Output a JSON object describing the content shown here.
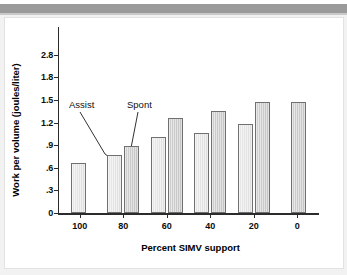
{
  "page": {
    "background_color": "#f2f2f2",
    "header_band_color": "#9a9a9a",
    "card_background": "#ffffff"
  },
  "chart_data": {
    "type": "bar",
    "title": "",
    "xlabel": "Percent SIMV support",
    "ylabel": "Work per volume (joules/liter)",
    "categories": [
      "100",
      "80",
      "60",
      "40",
      "20",
      "0"
    ],
    "series": [
      {
        "name": "Assist",
        "color": "#e4e4e4",
        "values": [
          0.66,
          0.77,
          1.01,
          1.06,
          1.18,
          null
        ]
      },
      {
        "name": "Spont",
        "color": "#cfcfcf",
        "values": [
          null,
          0.89,
          1.26,
          1.35,
          1.47,
          1.47
        ]
      }
    ],
    "ytick_labels": [
      "2.8",
      "1.8",
      "1.5",
      "1.2",
      ".9",
      ".6",
      ".3",
      "0"
    ],
    "ytick_values": [
      2.8,
      1.8,
      1.5,
      1.2,
      0.9,
      0.6,
      0.3,
      0
    ],
    "ylim": [
      0,
      2.8
    ],
    "axis_note": "evenly spaced ticks; scale is broken between 1.8 and 2.8",
    "grid": false,
    "legend": "annotations",
    "annotations": [
      {
        "text": "Assist",
        "points_to": "80 percent Assist bar"
      },
      {
        "text": "Spont",
        "points_to": "80 percent Spont bar"
      }
    ]
  }
}
